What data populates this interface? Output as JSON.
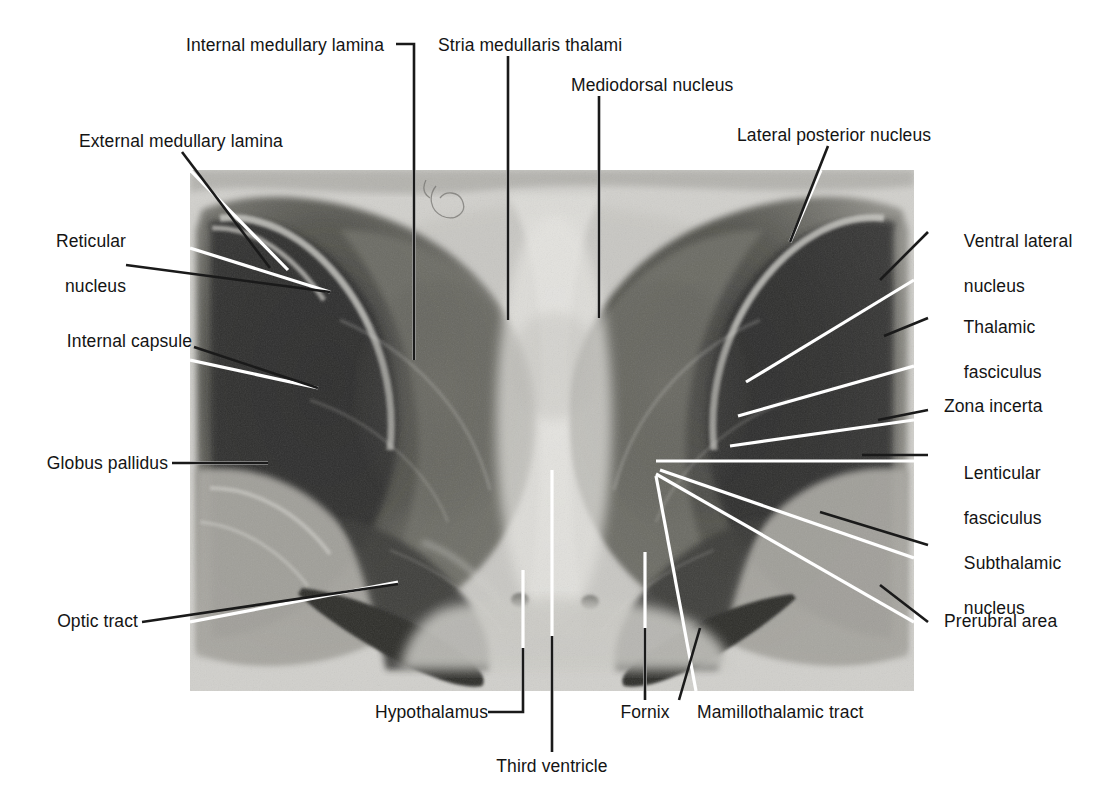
{
  "figure": {
    "plate": {
      "x": 190,
      "y": 170,
      "width": 724,
      "height": 521,
      "background_tone": "#cfcecb",
      "description": "Myelin-stained coronal brain section showing paired thalami flanking the third ventricle"
    },
    "palette": {
      "text": "#141414",
      "leader_outside": "#1a1a1a",
      "leader_inside": "#ffffff",
      "page_background": "#ffffff",
      "plate_light": "#d9d8d4",
      "plate_mid": "#9b9a96",
      "plate_dark": "#4a4a48",
      "plate_darkest": "#232323"
    }
  },
  "labels": {
    "internal_medullary_lamina": "Internal medullary lamina",
    "stria_medullaris_thalami": "Stria medullaris thalami",
    "mediodorsal_nucleus": "Mediodorsal nucleus",
    "lateral_posterior_nucleus": "Lateral posterior nucleus",
    "external_medullary_lamina": "External medullary lamina",
    "reticular_nucleus_line1": "Reticular",
    "reticular_nucleus_line2": "nucleus",
    "internal_capsule": "Internal capsule",
    "globus_pallidus": "Globus pallidus",
    "optic_tract": "Optic tract",
    "ventral_lateral_nucleus_line1": "Ventral lateral",
    "ventral_lateral_nucleus_line2": "nucleus",
    "thalamic_fasciculus_line1": "Thalamic",
    "thalamic_fasciculus_line2": "fasciculus",
    "zona_incerta": "Zona incerta",
    "lenticular_fasciculus_line1": "Lenticular",
    "lenticular_fasciculus_line2": "fasciculus",
    "subthalamic_nucleus_line1": "Subthalamic",
    "subthalamic_nucleus_line2": "nucleus",
    "prerubral_area": "Prerubral area",
    "hypothalamus": "Hypothalamus",
    "third_ventricle": "Third ventricle",
    "fornix": "Fornix",
    "mamillothalamic_tract": "Mamillothalamic tract"
  },
  "structures": [
    {
      "name": "Internal medullary lamina",
      "side": "top",
      "leader": "elbow"
    },
    {
      "name": "Stria medullaris thalami",
      "side": "top",
      "leader": "vertical"
    },
    {
      "name": "Mediodorsal nucleus",
      "side": "top",
      "leader": "vertical"
    },
    {
      "name": "Lateral posterior nucleus",
      "side": "top-right",
      "leader": "diagonal"
    },
    {
      "name": "External medullary lamina",
      "side": "top-left",
      "leader": "diagonal"
    },
    {
      "name": "Reticular nucleus",
      "side": "left",
      "leader": "diagonal"
    },
    {
      "name": "Internal capsule",
      "side": "left",
      "leader": "diagonal"
    },
    {
      "name": "Globus pallidus",
      "side": "left",
      "leader": "horizontal"
    },
    {
      "name": "Optic tract",
      "side": "left",
      "leader": "diagonal"
    },
    {
      "name": "Ventral lateral nucleus",
      "side": "right",
      "leader": "diagonal"
    },
    {
      "name": "Thalamic fasciculus",
      "side": "right",
      "leader": "diagonal"
    },
    {
      "name": "Zona incerta",
      "side": "right",
      "leader": "diagonal"
    },
    {
      "name": "Lenticular fasciculus",
      "side": "right",
      "leader": "horizontal"
    },
    {
      "name": "Subthalamic nucleus",
      "side": "right",
      "leader": "diagonal"
    },
    {
      "name": "Prerubral area",
      "side": "right",
      "leader": "diagonal"
    },
    {
      "name": "Hypothalamus",
      "side": "bottom",
      "leader": "elbow"
    },
    {
      "name": "Third ventricle",
      "side": "bottom",
      "leader": "vertical"
    },
    {
      "name": "Fornix",
      "side": "bottom",
      "leader": "vertical"
    },
    {
      "name": "Mamillothalamic tract",
      "side": "bottom",
      "leader": "diagonal"
    }
  ]
}
